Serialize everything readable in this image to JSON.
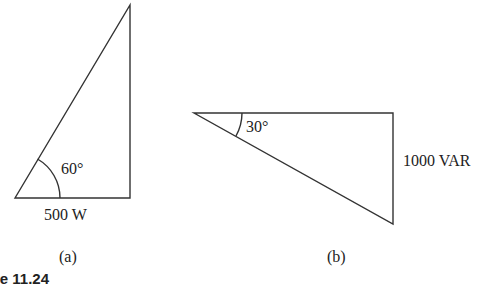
{
  "diagram_a": {
    "angle_label": "60°",
    "base_label": "500 W",
    "sublabel": "(a)"
  },
  "diagram_b": {
    "angle_label": "30°",
    "side_label": "1000 VAR",
    "sublabel": "(b)"
  },
  "caption_fragment": "re 11.24"
}
